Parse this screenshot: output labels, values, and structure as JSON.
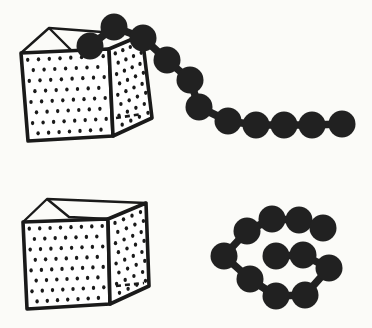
{
  "figure": {
    "name": "polymer-chain-escaping-box-diagram",
    "background": "#fbfbf8",
    "ink": "#1a1a1a",
    "bead_color": "#212121",
    "bead_radius": 13.5,
    "link_width": 7.5,
    "face_fill": "#ffffff",
    "outline_width": 3.6,
    "rim_line_width": 2.4,
    "dot_color": "#1a1a1a",
    "canvas": {
      "width": 372,
      "height": 328
    }
  },
  "panels": [
    {
      "name": "box-with-escaping-chain",
      "box": {
        "front": [
          [
            21,
            53
          ],
          [
            109,
            49
          ],
          [
            113,
            136
          ],
          [
            28,
            141
          ]
        ],
        "right": [
          [
            109,
            49
          ],
          [
            142,
            35
          ],
          [
            152,
            118
          ],
          [
            113,
            136
          ]
        ],
        "back_top_left": [
          49,
          28
        ],
        "inner_point": [
          72,
          51
        ],
        "dash_line": [
          [
            116,
            118
          ],
          [
            142,
            114
          ]
        ],
        "front_dots": {
          "cols": 8,
          "rows": 8
        },
        "right_dots": {
          "cols": 4,
          "rows": 8
        }
      },
      "chain": {
        "beads": [
          [
            90,
            46
          ],
          [
            114,
            27
          ],
          [
            143,
            38
          ],
          [
            167,
            60
          ],
          [
            190,
            80
          ],
          [
            199,
            107
          ],
          [
            228,
            121
          ],
          [
            256,
            125
          ],
          [
            284,
            125
          ],
          [
            312,
            125
          ],
          [
            342,
            124
          ]
        ],
        "links": [
          [
            0,
            1
          ],
          [
            1,
            2
          ],
          [
            2,
            3
          ],
          [
            3,
            4
          ],
          [
            4,
            5
          ],
          [
            5,
            6
          ],
          [
            6,
            7
          ],
          [
            7,
            8
          ],
          [
            8,
            9
          ],
          [
            9,
            10
          ]
        ]
      }
    },
    {
      "name": "empty-box-with-coiled-chain",
      "box": {
        "front": [
          [
            23,
            222
          ],
          [
            108,
            219
          ],
          [
            110,
            304
          ],
          [
            27,
            309
          ]
        ],
        "right": [
          [
            108,
            219
          ],
          [
            146,
            203
          ],
          [
            149,
            286
          ],
          [
            110,
            304
          ]
        ],
        "back_top_left": [
          47,
          199
        ],
        "inner_point": [
          69,
          217
        ],
        "dash_line": [
          [
            116,
            286
          ],
          [
            144,
            283
          ]
        ],
        "front_dots": {
          "cols": 8,
          "rows": 8
        },
        "right_dots": {
          "cols": 4,
          "rows": 8
        }
      },
      "chain": {
        "beads": [
          [
            247,
            231
          ],
          [
            272,
            219
          ],
          [
            299,
            220
          ],
          [
            323,
            228
          ],
          [
            329,
            268
          ],
          [
            305,
            295
          ],
          [
            276,
            296
          ],
          [
            250,
            279
          ],
          [
            224,
            256
          ],
          [
            276,
            256
          ],
          [
            303,
            255
          ]
        ],
        "links": [
          [
            9,
            10
          ],
          [
            10,
            4
          ],
          [
            4,
            5
          ],
          [
            5,
            6
          ],
          [
            6,
            7
          ],
          [
            7,
            8
          ],
          [
            8,
            0
          ],
          [
            0,
            1
          ],
          [
            1,
            2
          ],
          [
            2,
            3
          ]
        ]
      }
    }
  ]
}
